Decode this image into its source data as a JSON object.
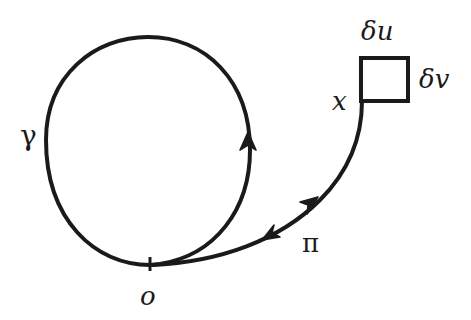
{
  "diagram": {
    "type": "loop-and-path",
    "stroke_color": "#1a1a1a",
    "background": "#ffffff",
    "labels": {
      "loop": "γ",
      "base_point": "o",
      "path": "π",
      "end_point": "x",
      "box_top": "δu",
      "box_right": "δv"
    },
    "elements": [
      {
        "id": "loop-gamma",
        "kind": "closed-curve",
        "arrow": "counterclockwise-up-right-side"
      },
      {
        "id": "path-pi",
        "kind": "curve",
        "from": "o",
        "to": "x",
        "arrows": [
          "toward-x",
          "toward-o"
        ]
      },
      {
        "id": "box",
        "kind": "square",
        "attached_at": "x",
        "side_labels": [
          "δu",
          "δv"
        ]
      }
    ]
  }
}
